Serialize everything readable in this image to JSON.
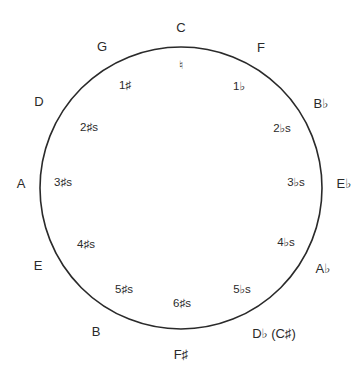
{
  "circle": {
    "cx": 181,
    "cy": 188,
    "r": 141,
    "stroke": "#2a2a2a"
  },
  "outer_keys": [
    {
      "label": "C",
      "x": 181,
      "y": 27
    },
    {
      "label": "F",
      "x": 261,
      "y": 47
    },
    {
      "label": "B♭",
      "x": 321,
      "y": 103
    },
    {
      "label": "E♭",
      "x": 344,
      "y": 183
    },
    {
      "label": "A♭",
      "x": 323,
      "y": 268
    },
    {
      "label": "D♭ (C♯)",
      "x": 274,
      "y": 333
    },
    {
      "label": "F♯",
      "x": 181,
      "y": 354
    },
    {
      "label": "B",
      "x": 96,
      "y": 331
    },
    {
      "label": "E",
      "x": 38,
      "y": 265
    },
    {
      "label": "A",
      "x": 21,
      "y": 183
    },
    {
      "label": "D",
      "x": 39,
      "y": 101
    },
    {
      "label": "G",
      "x": 102,
      "y": 46
    }
  ],
  "inner_signatures": [
    {
      "label": "♮",
      "x": 181,
      "y": 66
    },
    {
      "label": "1♭",
      "x": 239,
      "y": 87
    },
    {
      "label": "2♭s",
      "x": 282,
      "y": 129
    },
    {
      "label": "3♭s",
      "x": 296,
      "y": 183
    },
    {
      "label": "4♭s",
      "x": 286,
      "y": 243
    },
    {
      "label": "5♭s",
      "x": 242,
      "y": 290
    },
    {
      "label": "6♯s",
      "x": 182,
      "y": 304
    },
    {
      "label": "5♯s",
      "x": 124,
      "y": 290
    },
    {
      "label": "4♯s",
      "x": 86,
      "y": 245
    },
    {
      "label": "3♯s",
      "x": 63,
      "y": 183
    },
    {
      "label": "2♯s",
      "x": 89,
      "y": 128
    },
    {
      "label": "1♯",
      "x": 125,
      "y": 86
    }
  ]
}
